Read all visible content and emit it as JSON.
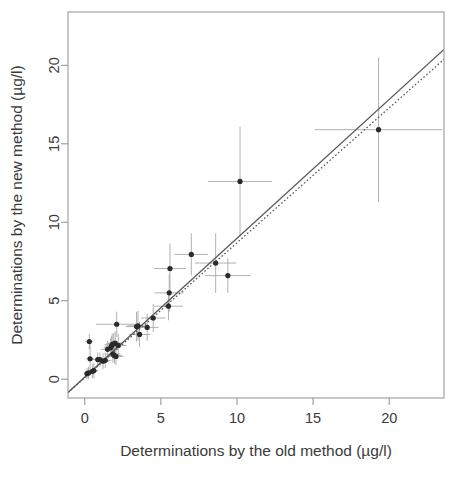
{
  "chart_data": {
    "type": "scatter",
    "title": "",
    "xlabel": "Determinations by the old method (µg/l)",
    "ylabel": "Determinations by the new method (µg/l)",
    "xlim": [
      -1.1,
      23.6
    ],
    "ylim": [
      -1.2,
      23.4
    ],
    "xticks": [
      0,
      5,
      10,
      15,
      20
    ],
    "yticks": [
      0,
      5,
      15,
      10,
      20
    ],
    "ytick_labels": [
      "0",
      "5",
      "10",
      "15",
      "20"
    ],
    "xtick_labels": [
      "0",
      "5",
      "10",
      "15",
      "20"
    ],
    "grid": false,
    "legend": null,
    "axis_colors": {
      "frame": "#9a9a9a",
      "text": "#3a3a3a",
      "point": "#2a2a2a",
      "errorbar": "#a8a8a8",
      "fit_line": "#5a5a5a",
      "identity_line": "#5a5a5a"
    },
    "lines": [
      {
        "name": "regression-line",
        "style": "solid",
        "slope": 0.885,
        "intercept": 0.13,
        "x_from": -1.1,
        "x_to": 23.6
      },
      {
        "name": "reference-line",
        "style": "dotted",
        "slope": 0.86,
        "intercept": 0.09,
        "x_from": -1.1,
        "x_to": 23.6
      }
    ],
    "points": [
      {
        "x": 0.15,
        "y": 0.35,
        "xerr": 0.2,
        "yerr": 0.35
      },
      {
        "x": 0.25,
        "y": 0.4,
        "xerr": 0.2,
        "yerr": 0.4
      },
      {
        "x": 0.3,
        "y": 2.4,
        "xerr": 0.25,
        "yerr": 0.5
      },
      {
        "x": 0.35,
        "y": 1.3,
        "xerr": 0.25,
        "yerr": 0.95
      },
      {
        "x": 0.5,
        "y": 0.5,
        "xerr": 0.3,
        "yerr": 0.45
      },
      {
        "x": 0.6,
        "y": 0.55,
        "xerr": 0.3,
        "yerr": 0.5
      },
      {
        "x": 0.85,
        "y": 1.25,
        "xerr": 0.35,
        "yerr": 0.45
      },
      {
        "x": 1.0,
        "y": 1.25,
        "xerr": 0.35,
        "yerr": 0.45
      },
      {
        "x": 1.2,
        "y": 1.15,
        "xerr": 0.4,
        "yerr": 0.5
      },
      {
        "x": 1.35,
        "y": 1.2,
        "xerr": 0.4,
        "yerr": 0.5
      },
      {
        "x": 1.5,
        "y": 1.9,
        "xerr": 0.45,
        "yerr": 0.55
      },
      {
        "x": 1.7,
        "y": 2.0,
        "xerr": 0.45,
        "yerr": 0.6
      },
      {
        "x": 1.75,
        "y": 2.1,
        "xerr": 0.45,
        "yerr": 0.65
      },
      {
        "x": 1.8,
        "y": 2.2,
        "xerr": 0.5,
        "yerr": 0.7
      },
      {
        "x": 1.85,
        "y": 1.6,
        "xerr": 0.5,
        "yerr": 0.55
      },
      {
        "x": 1.9,
        "y": 2.25,
        "xerr": 0.5,
        "yerr": 0.7
      },
      {
        "x": 1.95,
        "y": 1.5,
        "xerr": 0.5,
        "yerr": 0.5
      },
      {
        "x": 2.0,
        "y": 2.3,
        "xerr": 0.5,
        "yerr": 0.75
      },
      {
        "x": 2.05,
        "y": 1.45,
        "xerr": 0.5,
        "yerr": 0.55
      },
      {
        "x": 2.1,
        "y": 3.5,
        "xerr": 1.35,
        "yerr": 0.8
      },
      {
        "x": 2.2,
        "y": 2.15,
        "xerr": 0.55,
        "yerr": 0.75
      },
      {
        "x": 3.4,
        "y": 3.35,
        "xerr": 0.7,
        "yerr": 0.95
      },
      {
        "x": 3.5,
        "y": 3.4,
        "xerr": 0.7,
        "yerr": 0.95
      },
      {
        "x": 3.6,
        "y": 2.85,
        "xerr": 0.7,
        "yerr": 0.8
      },
      {
        "x": 4.1,
        "y": 3.3,
        "xerr": 0.75,
        "yerr": 0.85
      },
      {
        "x": 4.5,
        "y": 3.9,
        "xerr": 0.8,
        "yerr": 0.9
      },
      {
        "x": 5.5,
        "y": 4.65,
        "xerr": 0.95,
        "yerr": 0.9
      },
      {
        "x": 5.55,
        "y": 5.5,
        "xerr": 0.95,
        "yerr": 1.2
      },
      {
        "x": 5.6,
        "y": 7.05,
        "xerr": 1.05,
        "yerr": 1.6
      },
      {
        "x": 7.0,
        "y": 7.95,
        "xerr": 1.1,
        "yerr": 1.35
      },
      {
        "x": 8.6,
        "y": 7.4,
        "xerr": 1.35,
        "yerr": 1.9
      },
      {
        "x": 9.4,
        "y": 6.6,
        "xerr": 1.5,
        "yerr": 1.1
      },
      {
        "x": 10.2,
        "y": 12.6,
        "xerr": 2.1,
        "yerr": 3.5
      },
      {
        "x": 19.3,
        "y": 15.9,
        "xerr": 4.2,
        "yerr": 4.6
      }
    ]
  },
  "plot_geometry": {
    "left": 68,
    "right": 444,
    "top": 12,
    "bottom": 398,
    "cap_half_width": 0
  }
}
